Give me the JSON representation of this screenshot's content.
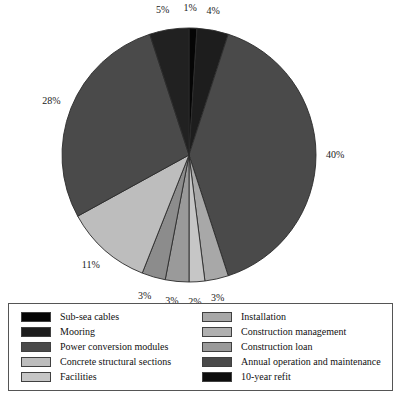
{
  "chart_data": {
    "type": "pie",
    "title": "",
    "subtitle": "",
    "xlabel": "",
    "ylabel": "",
    "legend_position": "bottom",
    "grid": false,
    "start_angle_deg": 0,
    "direction": "clockwise",
    "categories": [
      "Sub-sea cables",
      "Mooring",
      "Power conversion modules",
      "Concrete structural sections",
      "Facilities",
      "Installation",
      "Construction management",
      "Construction loan",
      "Annual operation and maintenance",
      "10-year refit"
    ],
    "values": [
      1,
      4,
      40,
      3,
      2,
      3,
      3,
      11,
      28,
      5
    ],
    "labels": [
      "1%",
      "4%",
      "40%",
      "3%",
      "2%",
      "3%",
      "3%",
      "11%",
      "28%",
      "5%"
    ],
    "colors": [
      "#050505",
      "#1d1d1d",
      "#4a4a4a",
      "#a8a8a8",
      "#c6c6c6",
      "#9a9a9a",
      "#8c8c8c",
      "#bdbdbd",
      "#4a4a4a",
      "#212121"
    ],
    "slice_order_clockwise_from_top": [
      "Sub-sea cables",
      "Mooring",
      "Power conversion modules",
      "Concrete structural sections",
      "Facilities",
      "Installation",
      "Construction management",
      "Construction loan",
      "Annual operation and maintenance",
      "10-year refit"
    ]
  },
  "pie": {
    "center_x": 189,
    "center_y": 155,
    "radius": 127,
    "stroke": "#2b2b2b"
  },
  "legend": {
    "columns": [
      {
        "items": [
          {
            "label": "Sub-sea cables",
            "color": "#050505"
          },
          {
            "label": "Mooring",
            "color": "#1d1d1d"
          },
          {
            "label": "Power conversion modules",
            "color": "#4a4a4a"
          },
          {
            "label": "Concrete structural sections",
            "color": "#bdbdbd"
          },
          {
            "label": "Facilities",
            "color": "#c6c6c6"
          }
        ]
      },
      {
        "items": [
          {
            "label": "Installation",
            "color": "#a8a8a8"
          },
          {
            "label": "Construction management",
            "color": "#b0b0b0"
          },
          {
            "label": "Construction loan",
            "color": "#9a9a9a"
          },
          {
            "label": "Annual operation and maintenance",
            "color": "#4a4a4a"
          },
          {
            "label": "10-year refit",
            "color": "#0d0d0d"
          }
        ]
      }
    ]
  },
  "caption": {
    "text": ""
  }
}
